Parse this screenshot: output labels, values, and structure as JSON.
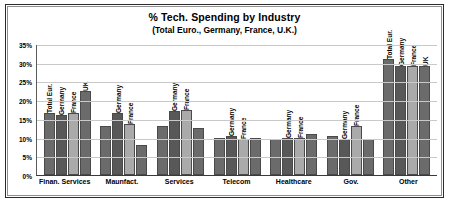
{
  "chart_data": {
    "type": "bar",
    "title": "% Tech. Spending by Industry",
    "subtitle": "(Total Euro., Germany, France, U.K.)",
    "xlabel": "",
    "ylabel": "",
    "ylim": [
      0,
      35
    ],
    "grid": true,
    "legend_position": "none",
    "y_ticks": [
      "0%",
      "5%",
      "10%",
      "15%",
      "20%",
      "25%",
      "30%",
      "35%"
    ],
    "y_tick_values": [
      0,
      5,
      10,
      15,
      20,
      25,
      30,
      35
    ],
    "categories": [
      "Finan. Services",
      "Maunfact.",
      "Services",
      "Telecom",
      "Healthcare",
      "Gov.",
      "Other"
    ],
    "series": [
      {
        "name": "Total Eur.",
        "values": [
          16.5,
          13.0,
          13.0,
          10.0,
          9.5,
          10.5,
          31.0
        ]
      },
      {
        "name": "Germany",
        "values": [
          16.0,
          16.5,
          17.0,
          10.5,
          10.0,
          9.5,
          29.0
        ]
      },
      {
        "name": "France",
        "values": [
          16.5,
          13.5,
          17.5,
          9.5,
          10.0,
          13.0,
          29.0
        ]
      },
      {
        "name": "UK",
        "values": [
          22.5,
          8.0,
          12.5,
          10.0,
          11.0,
          9.5,
          29.0
        ]
      }
    ],
    "bar_labels_per_group": [
      [
        "Total Eur.",
        "Germany",
        "France",
        "UK"
      ],
      [
        "",
        "Germany",
        "France",
        ""
      ],
      [
        "",
        "Germany",
        "France",
        ""
      ],
      [
        "",
        "Germany",
        "France",
        ""
      ],
      [
        "",
        "Germany",
        "France",
        ""
      ],
      [
        "",
        "Germany",
        "France",
        ""
      ],
      [
        "Total Eur.",
        "Germany",
        "France",
        "UK"
      ]
    ],
    "series_colors": [
      "#6b6b6b",
      "#585858",
      "#aaaaaa",
      "#6b6b6b"
    ]
  }
}
